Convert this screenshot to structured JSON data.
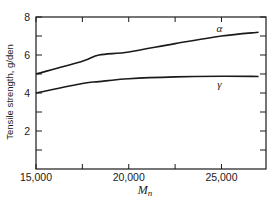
{
  "chart_data": {
    "type": "line",
    "title": "",
    "xlabel": "M_n",
    "xlabel_main": "M",
    "xlabel_sub": "n",
    "ylabel": "Tensile strength, g/den",
    "xlim": [
      15000,
      27400
    ],
    "ylim": [
      0,
      8
    ],
    "x_ticks": [
      15000,
      17500,
      20000,
      22500,
      25000
    ],
    "x_tick_labels": [
      "15,000",
      "",
      "20,000",
      "",
      "25,000"
    ],
    "y_ticks": [
      1,
      2,
      3,
      4,
      5,
      6,
      7,
      8
    ],
    "y_tick_labels": [
      "",
      "2",
      "",
      "4",
      "",
      "6",
      "",
      "8"
    ],
    "grid": false,
    "legend": "inline labels",
    "series": [
      {
        "name": "α",
        "x": [
          15000,
          17500,
          18400,
          20000,
          22500,
          25000,
          27000
        ],
        "values": [
          5.0,
          5.67,
          6.0,
          6.16,
          6.6,
          7.0,
          7.2
        ]
      },
      {
        "name": "γ",
        "x": [
          15000,
          17500,
          18400,
          20000,
          22500,
          25000,
          27000
        ],
        "values": [
          4.0,
          4.5,
          4.6,
          4.75,
          4.85,
          4.88,
          4.87
        ]
      }
    ]
  }
}
